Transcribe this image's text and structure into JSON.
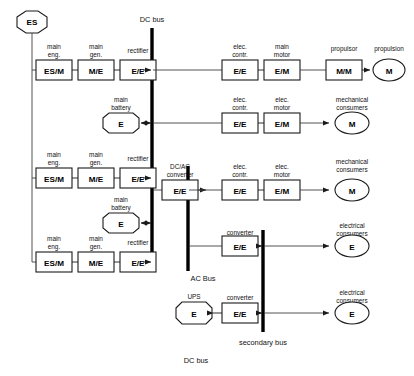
{
  "diagram": {
    "buses": [
      {
        "id": "dc-bus-main",
        "label": "DC bus",
        "orientation": "vertical"
      },
      {
        "id": "ac-bus",
        "label": "AC Bus",
        "orientation": "vertical"
      },
      {
        "id": "secondary-bus",
        "label": "secondary bus",
        "orientation": "vertical"
      },
      {
        "id": "dc-bus-bottom",
        "label": "DC bus",
        "orientation": "label-only"
      }
    ],
    "source": {
      "id": "es-source",
      "label": "ES",
      "shape": "octagon"
    },
    "generation_chains": [
      {
        "id": "chain-1",
        "stages": [
          {
            "id": "main-eng-1",
            "caption_line1": "main",
            "caption_line2": "eng.",
            "label": "ES/M",
            "shape": "box"
          },
          {
            "id": "main-gen-1",
            "caption_line1": "main",
            "caption_line2": "gen.",
            "label": "M/E",
            "shape": "box"
          },
          {
            "id": "rectifier-1",
            "caption_line1": "rectifier",
            "caption_line2": "",
            "label": "E/E",
            "shape": "box"
          }
        ]
      },
      {
        "id": "chain-2",
        "stages": [
          {
            "id": "main-eng-2",
            "caption_line1": "main",
            "caption_line2": "eng.",
            "label": "ES/M",
            "shape": "box"
          },
          {
            "id": "main-gen-2",
            "caption_line1": "main",
            "caption_line2": "gen.",
            "label": "M/E",
            "shape": "box"
          },
          {
            "id": "rectifier-2",
            "caption_line1": "rectifier",
            "caption_line2": "",
            "label": "E/E",
            "shape": "box"
          }
        ]
      },
      {
        "id": "chain-3",
        "stages": [
          {
            "id": "main-eng-3",
            "caption_line1": "main",
            "caption_line2": "eng.",
            "label": "ES/M",
            "shape": "box"
          },
          {
            "id": "main-gen-3",
            "caption_line1": "main",
            "caption_line2": "gen.",
            "label": "M/E",
            "shape": "box"
          },
          {
            "id": "rectifier-3",
            "caption_line1": "rectifier",
            "caption_line2": "",
            "label": "E/E",
            "shape": "box"
          }
        ]
      }
    ],
    "batteries": [
      {
        "id": "main-battery-1",
        "caption_line1": "main",
        "caption_line2": "battery",
        "label": "E",
        "shape": "octagon"
      },
      {
        "id": "main-battery-2",
        "caption_line1": "main",
        "caption_line2": "battery",
        "label": "E",
        "shape": "octagon"
      }
    ],
    "loads": {
      "propulsion_branch": [
        {
          "id": "elec-contr-prop",
          "caption_line1": "elec.",
          "caption_line2": "contr.",
          "label": "E/E",
          "shape": "box"
        },
        {
          "id": "main-motor",
          "caption_line1": "main",
          "caption_line2": "motor",
          "label": "E/M",
          "shape": "box"
        },
        {
          "id": "propulsor",
          "caption_line1": "propulsor",
          "caption_line2": "",
          "label": "M/M",
          "shape": "box"
        },
        {
          "id": "propulsion",
          "caption_line1": "propulsion",
          "caption_line2": "",
          "label": "M",
          "shape": "ellipse"
        }
      ],
      "mech_branch_dc": [
        {
          "id": "elec-contr-mech-dc",
          "caption_line1": "elec.",
          "caption_line2": "contr.",
          "label": "E/E",
          "shape": "box"
        },
        {
          "id": "elec-motor-dc",
          "caption_line1": "elec.",
          "caption_line2": "motor",
          "label": "E/M",
          "shape": "box"
        },
        {
          "id": "mech-consumers-dc",
          "caption_line1": "mechanical",
          "caption_line2": "consumers",
          "label": "M",
          "shape": "ellipse"
        }
      ],
      "mech_branch_ac": [
        {
          "id": "elec-contr-mech-ac",
          "caption_line1": "elec.",
          "caption_line2": "contr.",
          "label": "E/E",
          "shape": "box"
        },
        {
          "id": "elec-motor-ac",
          "caption_line1": "elec.",
          "caption_line2": "motor",
          "label": "E/M",
          "shape": "box"
        },
        {
          "id": "mech-consumers-ac",
          "caption_line1": "mechanical",
          "caption_line2": "consumers",
          "label": "M",
          "shape": "ellipse"
        }
      ],
      "electrical_branch_ac": [
        {
          "id": "converter-ac",
          "caption_line1": "converter",
          "caption_line2": "",
          "label": "E/E",
          "shape": "box"
        },
        {
          "id": "elec-consumers-ac",
          "caption_line1": "electrical",
          "caption_line2": "consumers",
          "label": "E",
          "shape": "ellipse"
        }
      ],
      "electrical_branch_secondary": [
        {
          "id": "elec-consumers-secondary",
          "caption_line1": "electrical",
          "caption_line2": "consumers",
          "label": "E",
          "shape": "ellipse"
        }
      ]
    },
    "converters": [
      {
        "id": "dcac-converter",
        "caption_line1": "DC/AC",
        "caption_line2": "converter",
        "label": "E/E",
        "shape": "box"
      },
      {
        "id": "ups-converter",
        "caption_line1": "converter",
        "caption_line2": "",
        "label": "E/E",
        "shape": "box"
      }
    ],
    "ups": {
      "id": "ups-node",
      "caption_line1": "UPS",
      "caption_line2": "",
      "label": "E",
      "shape": "octagon"
    },
    "colors": {
      "stroke": "#1a1a1a",
      "wire": "#3f3f3f",
      "bus": "#000000",
      "background": "#ffffff"
    }
  }
}
